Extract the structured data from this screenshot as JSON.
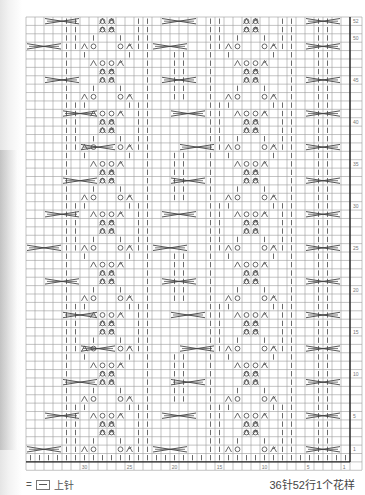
{
  "chart": {
    "title": "36针52行1个花样",
    "stitches": 36,
    "rows": 52,
    "row_labels": [
      "1",
      "5",
      "10",
      "15",
      "20",
      "25",
      "30",
      "35",
      "40",
      "45",
      "50",
      "52"
    ],
    "col_labels": [
      "1",
      "5",
      "10",
      "15",
      "20",
      "25",
      "30"
    ],
    "grid_color": "#9a9a9a",
    "symbol_color": "#444444"
  },
  "legend": {
    "equals": "=",
    "symbol_name": "purl-box-icon",
    "label": "上针"
  },
  "caption": "36针52行1个花样"
}
